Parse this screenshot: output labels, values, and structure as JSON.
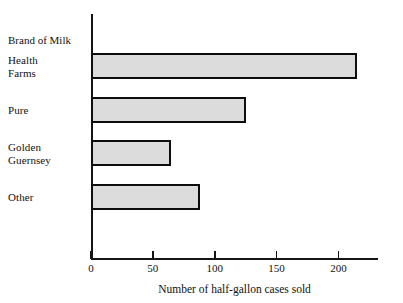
{
  "chart_data": {
    "type": "bar",
    "orientation": "horizontal",
    "title": "",
    "xlabel": "Number of half-gallon cases sold",
    "ylabel": "Brand of Milk",
    "categories": [
      "Health Farms",
      "Pure",
      "Golden Guernsey",
      "Other"
    ],
    "category_labels_multiline": [
      "Health\nFarms",
      "Pure",
      "Golden\nGuernsey",
      "Other"
    ],
    "values": [
      215,
      125,
      65,
      88
    ],
    "xlim": [
      0,
      232
    ],
    "ylim": null,
    "xticks": [
      0,
      50,
      100,
      150,
      200
    ],
    "xtick_labels": [
      "0",
      "50",
      "100",
      "150",
      "200"
    ],
    "grid": false,
    "legend": false,
    "bar_fill_color": "#dcdcdc",
    "bar_edge_color": "#0d0d0d",
    "axis_color": "#151515",
    "background_color": "#ffffff"
  },
  "axes": {
    "y_axis_title": "Brand of Milk",
    "x_axis_title": "Number of half-gallon cases sold"
  },
  "bars": [
    {
      "label": "Health\nFarms",
      "value": 215
    },
    {
      "label": "Pure",
      "value": 125
    },
    {
      "label": "Golden\nGuernsey",
      "value": 65
    },
    {
      "label": "Other",
      "value": 88
    }
  ],
  "ticks": [
    {
      "label": "0",
      "value": 0
    },
    {
      "label": "50",
      "value": 50
    },
    {
      "label": "100",
      "value": 100
    },
    {
      "label": "150",
      "value": 150
    },
    {
      "label": "200",
      "value": 200
    }
  ]
}
